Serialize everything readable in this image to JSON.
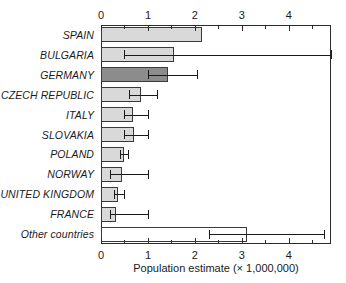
{
  "chart_data": {
    "type": "bar",
    "orientation": "horizontal",
    "title": "",
    "xlabel": "Population estimate (× 1,000,000)",
    "ylabel": "",
    "xlim": [
      0,
      4.9
    ],
    "xticks": [
      0,
      1,
      2,
      3,
      4
    ],
    "xtick_labels": [
      "0",
      "1",
      "2",
      "3",
      "4"
    ],
    "minor_tick_interval": 0.5,
    "grid": false,
    "legend": null,
    "axis_positions": [
      "top",
      "bottom"
    ],
    "categories": [
      "SPAIN",
      "BULGARIA",
      "GERMANY",
      "CZECH REPUBLIC",
      "ITALY",
      "SLOVAKIA",
      "POLAND",
      "NORWAY",
      "UNITED KINGDOM",
      "FRANCE",
      "Other countries"
    ],
    "values": [
      2.15,
      1.55,
      1.43,
      0.85,
      0.68,
      0.7,
      0.48,
      0.45,
      0.37,
      0.32,
      3.1
    ],
    "error_low": [
      null,
      0.5,
      1.0,
      0.6,
      0.5,
      0.5,
      0.4,
      0.2,
      0.28,
      0.2,
      2.3
    ],
    "error_high": [
      null,
      4.9,
      2.05,
      1.2,
      1.0,
      1.0,
      0.58,
      1.0,
      0.5,
      1.0,
      4.75
    ],
    "bar_fills": [
      "#d9d9d9",
      "#d9d9d9",
      "#8c8c8c",
      "#d9d9d9",
      "#d9d9d9",
      "#d9d9d9",
      "#d9d9d9",
      "#d9d9d9",
      "#d9d9d9",
      "#d9d9d9",
      "#ffffff"
    ],
    "error_clipped": [
      false,
      true,
      false,
      false,
      false,
      false,
      false,
      false,
      false,
      false,
      false
    ],
    "colors": {
      "bar_light": "#d9d9d9",
      "bar_dark": "#8c8c8c",
      "bar_white": "#ffffff",
      "bar_edge": "#3a3a3a",
      "axis": "#2b2b2b",
      "text": "#1a1a1a",
      "background": "#ffffff"
    }
  }
}
